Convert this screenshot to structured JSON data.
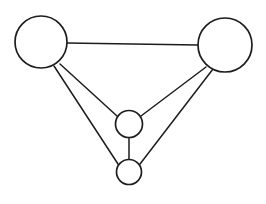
{
  "diagram": {
    "type": "node-link-graph",
    "background_color": "#ffffff",
    "stroke_color": "#1d1d1d",
    "node_fill_color": "#ffffff",
    "canvas": {
      "width": 266,
      "height": 204
    },
    "node_count": "4",
    "edge_count": "6",
    "nodes": [
      {
        "id": "A",
        "label": "",
        "cx": 41,
        "cy": 42,
        "r": 26,
        "size": "large",
        "position": "top-left"
      },
      {
        "id": "B",
        "label": "",
        "cx": 225,
        "cy": 45,
        "r": 27,
        "size": "large",
        "position": "top-right"
      },
      {
        "id": "C",
        "label": "",
        "cx": 129,
        "cy": 124,
        "r": 13.5,
        "size": "small",
        "position": "center"
      },
      {
        "id": "D",
        "label": "",
        "cx": 129,
        "cy": 172,
        "r": 12.5,
        "size": "small",
        "position": "bottom-center"
      }
    ],
    "edges": [
      {
        "id": "A-B",
        "from": "A",
        "to": "B",
        "x1": 67,
        "y1": 43,
        "x2": 198,
        "y2": 45
      },
      {
        "id": "A-C",
        "from": "A",
        "to": "C",
        "x1": 60,
        "y1": 64,
        "x2": 117,
        "y2": 116
      },
      {
        "id": "A-D",
        "from": "A",
        "to": "D",
        "x1": 54,
        "y1": 66,
        "x2": 118,
        "y2": 164
      },
      {
        "id": "B-C",
        "from": "B",
        "to": "C",
        "x1": 206,
        "y1": 67,
        "x2": 141,
        "y2": 116
      },
      {
        "id": "B-D",
        "from": "B",
        "to": "D",
        "x1": 213,
        "y1": 69,
        "x2": 140,
        "y2": 164
      },
      {
        "id": "C-D",
        "from": "C",
        "to": "D",
        "x1": 129,
        "y1": 137,
        "x2": 129,
        "y2": 160
      }
    ]
  }
}
